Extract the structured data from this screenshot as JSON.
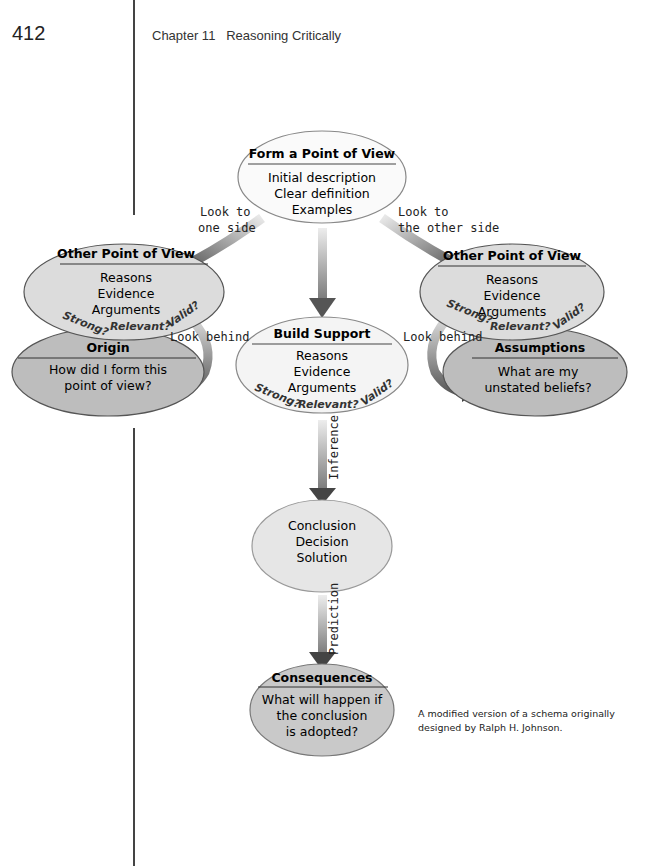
{
  "header": {
    "page_number": "412",
    "running_head": "Chapter 11   Reasoning Critically"
  },
  "diagram": {
    "top": {
      "title": "Form a Point of View",
      "lines": [
        "Initial description",
        "Clear definition",
        "Examples"
      ]
    },
    "left_opv": {
      "title": "Other Point of View",
      "lines": [
        "Reasons",
        "Evidence",
        "Arguments"
      ],
      "criteria": [
        "Strong?",
        "Relevant?",
        "Valid?"
      ]
    },
    "right_opv": {
      "title": "Other Point of View",
      "lines": [
        "Reasons",
        "Evidence",
        "Arguments"
      ],
      "criteria": [
        "Strong?",
        "Relevant?",
        "Valid?"
      ]
    },
    "origin": {
      "title": "Origin",
      "lines": [
        "How did I form this",
        "point of view?"
      ]
    },
    "assumptions": {
      "title": "Assumptions",
      "lines": [
        "What are my",
        "unstated beliefs?"
      ]
    },
    "build": {
      "title": "Build Support",
      "lines": [
        "Reasons",
        "Evidence",
        "Arguments"
      ],
      "criteria": [
        "Strong?",
        "Relevant?",
        "Valid?"
      ]
    },
    "conclusion": {
      "lines": [
        "Conclusion",
        "Decision",
        "Solution"
      ]
    },
    "consequences": {
      "title": "Consequences",
      "lines": [
        "What will happen if",
        "the conclusion",
        "is adopted?"
      ]
    },
    "labels": {
      "look_one_1": "Look to",
      "look_one_2": "one side",
      "look_other_1": "Look to",
      "look_other_2": "the other side",
      "look_behind_left": "Look behind",
      "look_behind_right": "Look behind",
      "inference": "Inference",
      "prediction": "Prediction"
    }
  },
  "credit": "A modified version of a schema originally designed by Ralph H. Johnson."
}
